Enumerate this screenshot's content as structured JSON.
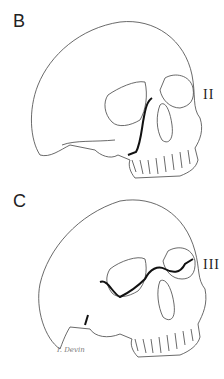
{
  "panels": [
    {
      "letter": "B",
      "fracture_label": "II"
    },
    {
      "letter": "C",
      "fracture_label": "III"
    }
  ],
  "signature": "I. Devin",
  "colors": {
    "line": "#333333",
    "fracture": "#111111",
    "shade": "#cccccc"
  }
}
